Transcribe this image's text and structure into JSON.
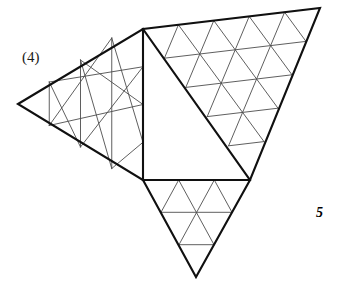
{
  "page": {
    "width": 337,
    "height": 282,
    "background_color": "#ffffff",
    "kind": "geometric-lattice-figure"
  },
  "labels": {
    "part_label": "(4)",
    "figure_number": "5"
  },
  "style": {
    "outline_color": "#101010",
    "outline_width": 2.0,
    "lattice_color": "#4a4a4a",
    "lattice_width": 0.9,
    "fill_color": "#ffffff"
  },
  "geometry": {
    "description": "Polygonal figure made of triangular-lattice regions: a left wing, an empty central quadrilateral, a large right triangular region, and a small bottom tail triangle.",
    "key_points": {
      "left_tip": [
        18,
        104
      ],
      "top_mid": [
        143,
        29
      ],
      "top_right": [
        320,
        8
      ],
      "right_low": [
        250,
        180
      ],
      "square_bottom_left": [
        143,
        180
      ],
      "tail_apex": [
        196,
        277
      ]
    },
    "regions": [
      {
        "name": "left-wing",
        "shape": "triangle-lattice",
        "rows": 4,
        "vertices": [
          [
            18,
            104
          ],
          [
            143,
            29
          ],
          [
            143,
            180
          ]
        ]
      },
      {
        "name": "central-empty-quad",
        "shape": "empty",
        "vertices": [
          [
            143,
            29
          ],
          [
            250,
            180
          ],
          [
            143,
            180
          ]
        ]
      },
      {
        "name": "right-wing",
        "shape": "triangle-lattice",
        "rows": 5,
        "vertices": [
          [
            143,
            29
          ],
          [
            320,
            8
          ],
          [
            250,
            180
          ]
        ]
      },
      {
        "name": "bottom-tail",
        "shape": "triangle-lattice",
        "rows": 3,
        "vertices": [
          [
            143,
            180
          ],
          [
            250,
            180
          ],
          [
            196,
            277
          ]
        ]
      }
    ],
    "outline_path": "M18,104 L143,29 L320,8 L250,180 L196,277 L143,180 Z"
  },
  "lattice": {
    "left_wing_lines": [
      [
        [
          52.25,
          126.25
        ],
        [
          105.5,
          51.0
        ]
      ],
      [
        [
          86.5,
          148.5
        ],
        [
          68.0,
          73.0
        ]
      ],
      [
        [
          120.75,
          170.75
        ],
        [
          30.5,
          95.0
        ]
      ],
      [
        [
          49.25,
          82.0
        ],
        [
          143.0,
          66.75
        ]
      ],
      [
        [
          80.5,
          60.0
        ],
        [
          143.0,
          104.5
        ]
      ],
      [
        [
          111.75,
          38.0
        ],
        [
          143.0,
          142.25
        ]
      ],
      [
        [
          49.25,
          82.0
        ],
        [
          49.25,
          125.5
        ]
      ],
      [
        [
          80.5,
          60.0
        ],
        [
          80.5,
          147.0
        ]
      ],
      [
        [
          111.75,
          38.0
        ],
        [
          111.75,
          168.5
        ]
      ]
    ],
    "right_wing_rows": 5,
    "tail_rows": 3
  }
}
